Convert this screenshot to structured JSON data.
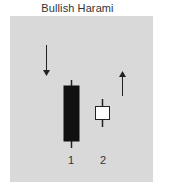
{
  "title": "Bullish Harami",
  "colors": {
    "panel": "#d9d9d9",
    "bearish_body": "#111111",
    "bullish_body": "#ffffff",
    "stroke": "#222222"
  },
  "candles": [
    {
      "label": "1",
      "type": "bearish",
      "color": "black"
    },
    {
      "label": "2",
      "type": "bullish",
      "color": "white"
    }
  ],
  "arrows": [
    {
      "direction": "down",
      "meaning": "prior downtrend"
    },
    {
      "direction": "up",
      "meaning": "expected reversal up"
    }
  ],
  "labels": {
    "candle1": "1",
    "candle2": "2"
  }
}
